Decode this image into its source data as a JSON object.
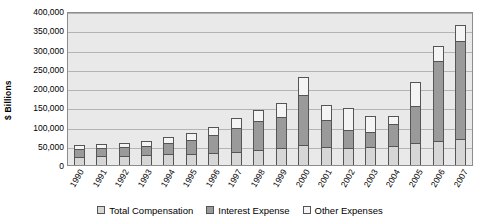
{
  "chart_data": {
    "type": "bar",
    "stacked": true,
    "title": "",
    "subtitle": "",
    "xlabel": "",
    "ylabel": "$ Billions",
    "ylim": [
      0,
      400000
    ],
    "ytick_step": 50000,
    "grid": true,
    "legend_position": "bottom",
    "categories": [
      "1990",
      "1991",
      "1992",
      "1993",
      "1994",
      "1995",
      "1996",
      "1997",
      "1998",
      "1999",
      "2000",
      "2001",
      "2002",
      "2003",
      "2004",
      "2005",
      "2006",
      "2007"
    ],
    "ytick_labels": [
      "0",
      "50,000",
      "100,000",
      "150,000",
      "200,000",
      "250,000",
      "300,000",
      "350,000",
      "400,000"
    ],
    "ytick_values": [
      0,
      50000,
      100000,
      150000,
      200000,
      250000,
      300000,
      350000,
      400000
    ],
    "series": [
      {
        "name": "Total Compensation",
        "color": "#d6d6d6",
        "values": [
          20000,
          21000,
          22000,
          24000,
          26000,
          28000,
          30000,
          33000,
          38000,
          42000,
          50000,
          44000,
          42000,
          44000,
          48000,
          54000,
          60000,
          66000
        ]
      },
      {
        "name": "Interest Expense",
        "color": "#9a9a9a",
        "values": [
          22000,
          23000,
          24000,
          26000,
          30000,
          37000,
          47000,
          62000,
          76000,
          82000,
          132000,
          72000,
          48000,
          42000,
          58000,
          98000,
          210000,
          256000
        ]
      },
      {
        "name": "Other Expenses",
        "color": "#f4f4f4",
        "values": [
          10000,
          10000,
          11000,
          12000,
          16000,
          18000,
          22000,
          27000,
          30000,
          36000,
          46000,
          40000,
          57000,
          42000,
          22000,
          64000,
          40000,
          41000
        ]
      }
    ],
    "totals": [
      52000,
      54000,
      57000,
      62000,
      72000,
      83000,
      99000,
      122000,
      144000,
      160000,
      228000,
      156000,
      147000,
      128000,
      128000,
      216000,
      310000,
      363000
    ]
  },
  "legend": {
    "items": [
      {
        "label": "Total Compensation",
        "swatch": "legend-swatch-total-compensation"
      },
      {
        "label": "Interest Expense",
        "swatch": "legend-swatch-interest-expense"
      },
      {
        "label": "Other Expenses",
        "swatch": "legend-swatch-other-expenses"
      }
    ]
  }
}
